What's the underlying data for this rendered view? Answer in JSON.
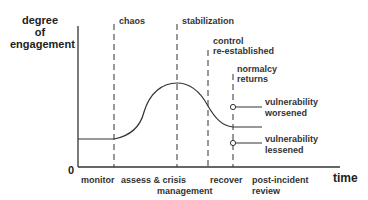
{
  "diagram": {
    "type": "phase-curve",
    "y_axis": {
      "label_lines": [
        "degree",
        "of",
        "engagement"
      ],
      "origin_label": "0"
    },
    "x_axis": {
      "label": "time"
    },
    "milestones": [
      {
        "id": "chaos",
        "lines": [
          "chaos"
        ]
      },
      {
        "id": "stabilization",
        "lines": [
          "stabilization"
        ]
      },
      {
        "id": "control",
        "lines": [
          "control",
          "re-established"
        ]
      },
      {
        "id": "normalcy",
        "lines": [
          "normalcy",
          "returns"
        ]
      }
    ],
    "phases": [
      {
        "id": "monitor",
        "lines": [
          "monitor"
        ]
      },
      {
        "id": "assess",
        "lines": [
          "assess & crisis",
          "management"
        ]
      },
      {
        "id": "recover",
        "lines": [
          "recover"
        ]
      },
      {
        "id": "review",
        "lines": [
          "post-incident",
          "review"
        ]
      }
    ],
    "outcomes": [
      {
        "id": "worsened",
        "lines": [
          "vulnerability",
          "worsened"
        ]
      },
      {
        "id": "lessened",
        "lines": [
          "vulnerability",
          "lessened"
        ]
      }
    ],
    "colors": {
      "line": "#333333",
      "text": "#333333",
      "background": "#ffffff"
    }
  }
}
